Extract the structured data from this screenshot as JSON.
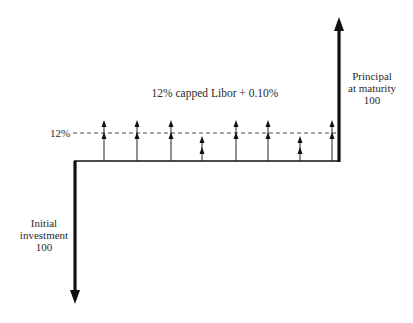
{
  "diagram": {
    "title": "12% capped Libor + 0.10%",
    "cap_label": "12%",
    "initial": {
      "line1": "Initial",
      "line2": "investment",
      "amount": "100"
    },
    "principal": {
      "line1": "Principal",
      "line2": "at maturity",
      "amount": "100"
    },
    "colors": {
      "ink": "#111111",
      "text": "#2a2a2a",
      "dash": "#333333",
      "background": "#ffffff"
    },
    "coupon_flows": [
      {
        "period": 1,
        "capped": true
      },
      {
        "period": 2,
        "capped": true
      },
      {
        "period": 3,
        "capped": true
      },
      {
        "period": 4,
        "capped": false
      },
      {
        "period": 5,
        "capped": true
      },
      {
        "period": 6,
        "capped": true
      },
      {
        "period": 7,
        "capped": false
      },
      {
        "period": 8,
        "capped": true
      }
    ]
  }
}
